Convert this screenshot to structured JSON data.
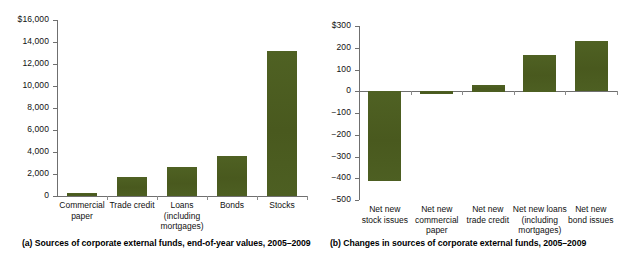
{
  "figure": {
    "background": "#ffffff",
    "bar_color": "#4c5d21",
    "axis_color": "#6f6f6f"
  },
  "panel_a": {
    "caption": "(a) Sources of corporate external funds, end-of-year values, 2005–2009",
    "chart_data": {
      "type": "bar",
      "title": "",
      "subtitle": "",
      "xlabel": "",
      "ylabel": "",
      "ylim": [
        0,
        16000
      ],
      "grid": false,
      "legend": "none",
      "ytick_labels": [
        "$16,000",
        "14,000",
        "12,000",
        "10,000",
        "8,000",
        "6,000",
        "4,000",
        "2,000",
        "0"
      ],
      "ytick_values": [
        16000,
        14000,
        12000,
        10000,
        8000,
        6000,
        4000,
        2000,
        0
      ],
      "categories": [
        "Commercial\npaper",
        "Trade credit",
        "Loans\n(including\nmortgages)",
        "Bonds",
        "Stocks"
      ],
      "category_lines": [
        [
          "Commercial",
          "paper"
        ],
        [
          "Trade credit"
        ],
        [
          "Loans",
          "(including",
          "mortgages)"
        ],
        [
          "Bonds"
        ],
        [
          "Stocks"
        ]
      ],
      "values": [
        300,
        1700,
        2600,
        3600,
        13200
      ]
    }
  },
  "panel_b": {
    "caption": "(b) Changes in sources of corporate external funds, 2005–2009",
    "chart_data": {
      "type": "bar",
      "title": "",
      "subtitle": "",
      "xlabel": "",
      "ylabel": "",
      "ylim": [
        -500,
        300
      ],
      "grid": false,
      "legend": "none",
      "ytick_labels": [
        "$300",
        "200",
        "100",
        "0",
        "−100",
        "−200",
        "−300",
        "−400",
        "−500"
      ],
      "ytick_values": [
        300,
        200,
        100,
        0,
        -100,
        -200,
        -300,
        -400,
        -500
      ],
      "categories": [
        "Net new stock issues",
        "Net new commercial paper",
        "Net new trade credit",
        "Net new loans (including mortgages)",
        "Net new bond issues"
      ],
      "category_lines": [
        [
          "Net new",
          "stock issues"
        ],
        [
          "Net new",
          "commercial",
          "paper"
        ],
        [
          "Net new",
          "trade credit"
        ],
        [
          "Net new loans",
          "(including",
          "mortgages)"
        ],
        [
          "Net new",
          "bond issues"
        ]
      ],
      "values": [
        -415,
        -15,
        30,
        168,
        230
      ]
    }
  }
}
